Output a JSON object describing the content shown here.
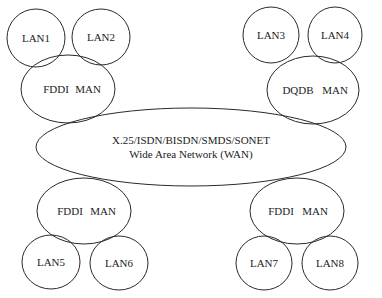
{
  "diagram": {
    "type": "network-topology",
    "stroke_color": "#2a2a2a",
    "text_color": "#222222",
    "background": "#ffffff",
    "wan": {
      "line1": "X.25/ISDN/BISDN/SMDS/SONET",
      "line2": "Wide Area Network (WAN)"
    },
    "mans": [
      {
        "id": "man-top-left",
        "label_a": "FDDI",
        "label_b": "MAN"
      },
      {
        "id": "man-top-right",
        "label_a": "DQDB",
        "label_b": "MAN"
      },
      {
        "id": "man-bottom-left",
        "label_a": "FDDI",
        "label_b": "MAN"
      },
      {
        "id": "man-bottom-right",
        "label_a": "FDDI",
        "label_b": "MAN"
      }
    ],
    "lans": [
      {
        "label": "LAN1",
        "attached_to": "man-top-left"
      },
      {
        "label": "LAN2",
        "attached_to": "man-top-left"
      },
      {
        "label": "LAN3",
        "attached_to": "man-top-right"
      },
      {
        "label": "LAN4",
        "attached_to": "man-top-right"
      },
      {
        "label": "LAN5",
        "attached_to": "man-bottom-left"
      },
      {
        "label": "LAN6",
        "attached_to": "man-bottom-left"
      },
      {
        "label": "LAN7",
        "attached_to": "man-bottom-right"
      },
      {
        "label": "LAN8",
        "attached_to": "man-bottom-right"
      }
    ]
  }
}
